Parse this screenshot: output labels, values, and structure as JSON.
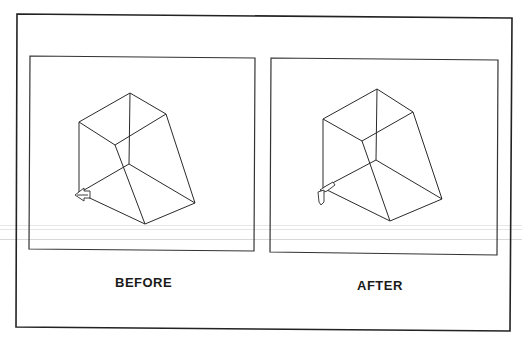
{
  "figure": {
    "panels": [
      {
        "id": "before",
        "caption": "BEFORE",
        "frame": {
          "x": 30,
          "y": 56,
          "w": 225,
          "h": 195
        },
        "wireframe": {
          "vertices": {
            "top": [
              130,
              93
            ],
            "left_top": [
              79,
              122
            ],
            "right_top": [
              166,
              114
            ],
            "inner_top": [
              115,
              145
            ],
            "back_bottom": [
              129,
              164
            ],
            "left_bottom": [
              79,
              193
            ],
            "right_bottom": [
              195,
              203
            ],
            "bottom": [
              145,
              224
            ]
          }
        },
        "cursor_icon": "arrow-left-icon"
      },
      {
        "id": "after",
        "caption": "AFTER",
        "frame": {
          "x": 271,
          "y": 58,
          "w": 226,
          "h": 197
        },
        "wireframe": {
          "vertices": {
            "top": [
              377,
              89
            ],
            "left_top": [
              323,
              119
            ],
            "right_top": [
              413,
              112
            ],
            "inner_top": [
              362,
              141
            ],
            "back_bottom": [
              376,
              160
            ],
            "left_bottom": [
              323,
              188
            ],
            "right_bottom": [
              442,
              199
            ],
            "bottom": [
              390,
              221
            ]
          }
        },
        "cursor_icon": "arrow-down-icon"
      }
    ],
    "line_color": "#2a2a2a",
    "frame_color": "#333333"
  }
}
